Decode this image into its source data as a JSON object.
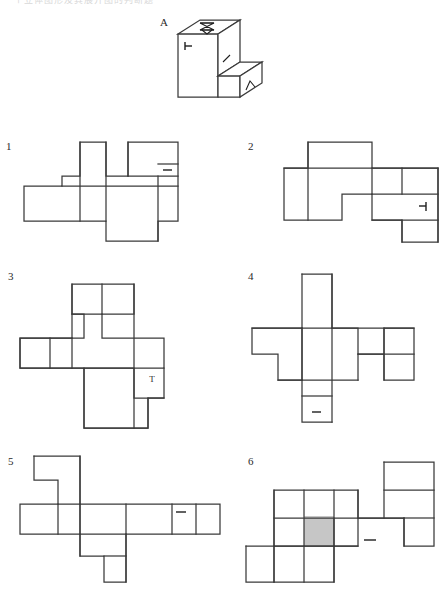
{
  "header": {
    "clipped_text": "一个立体图形及其展开图的判断题"
  },
  "figure": {
    "label": "A",
    "face_marks": [
      {
        "face": "top",
        "symbol": "hourglass-bowtie"
      },
      {
        "face": "front-left",
        "symbol": "left-tack"
      },
      {
        "face": "inner-vertical",
        "symbol": "slash"
      },
      {
        "face": "right-side",
        "symbol": "caret-up"
      }
    ]
  },
  "options": [
    {
      "number": "1",
      "name": "net-option-1",
      "marks": [
        {
          "symbol": "dash",
          "cell": "right-column-upper"
        }
      ],
      "shaded_cells": 0
    },
    {
      "number": "2",
      "name": "net-option-2",
      "marks": [
        {
          "symbol": "right-tack",
          "cell": "right-edge-middle"
        }
      ],
      "shaded_cells": 0
    },
    {
      "number": "3",
      "name": "net-option-3",
      "marks": [
        {
          "symbol": "T",
          "cell": "lower-right-of-bar"
        }
      ],
      "shaded_cells": 0
    },
    {
      "number": "4",
      "name": "net-option-4",
      "marks": [
        {
          "symbol": "dash",
          "cell": "bottom-cell"
        }
      ],
      "shaded_cells": 0
    },
    {
      "number": "5",
      "name": "net-option-5",
      "marks": [
        {
          "symbol": "dash",
          "cell": "right-bar-cell"
        }
      ],
      "shaded_cells": 0
    },
    {
      "number": "6",
      "name": "net-option-6",
      "marks": [
        {
          "symbol": "dash",
          "cell": "middle-right"
        }
      ],
      "shaded_cells": 1,
      "shade_color": "#c6c6c6"
    }
  ],
  "colors": {
    "stroke": "#3a3a3a",
    "mark": "#1f1f1f",
    "shade": "#c6c6c6",
    "background": "#ffffff"
  }
}
